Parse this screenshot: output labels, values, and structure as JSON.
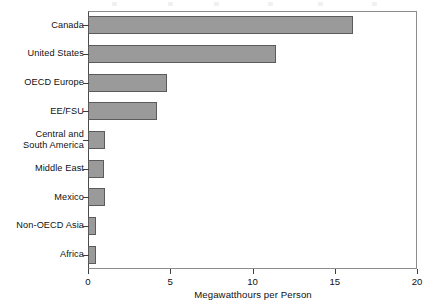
{
  "chart_data": {
    "type": "bar",
    "orientation": "horizontal",
    "title": "",
    "xlabel": "Megawatthours per Person",
    "ylabel": "",
    "xlim": [
      0,
      20
    ],
    "xticks": [
      0,
      5,
      10,
      15,
      20
    ],
    "xtick_labels": [
      "0",
      "5",
      "10",
      "15",
      "20"
    ],
    "grid": false,
    "legend": null,
    "bar_color": "#9a9a9a",
    "bar_edge_color": "#5b5b5b",
    "categories": [
      "Canada",
      "United States",
      "OECD Europe",
      "EE/FSU",
      "Central and\nSouth America",
      "Middle East",
      "Mexico",
      "Non-OECD Asia",
      "Africa"
    ],
    "values": [
      16.1,
      11.4,
      4.8,
      4.2,
      1.05,
      1.0,
      1.05,
      0.5,
      0.5
    ]
  }
}
